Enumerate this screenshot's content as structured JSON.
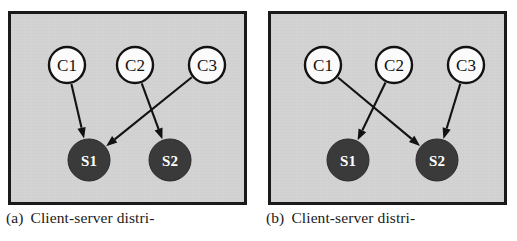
{
  "figure": {
    "width": 517,
    "height": 241,
    "background": "#ffffff",
    "panel_background": "#d3d3d3",
    "frame_color": "#1a1a1a",
    "client_node_fill": "#fbfbfb",
    "server_node_fill": "#3a3a3a",
    "edge_color": "#121212"
  },
  "panels": [
    {
      "id": "panel-a",
      "caption_tag": "(a)",
      "caption_text": "Client-server  distri-",
      "clients": [
        {
          "label": "C1",
          "cx": 56,
          "cy": 51,
          "r": 18
        },
        {
          "label": "C2",
          "cx": 124,
          "cy": 51,
          "r": 18
        },
        {
          "label": "C3",
          "cx": 196,
          "cy": 51,
          "r": 18
        }
      ],
      "servers": [
        {
          "label": "S1",
          "cx": 78,
          "cy": 146,
          "r": 21
        },
        {
          "label": "S2",
          "cx": 159,
          "cy": 146,
          "r": 21
        }
      ],
      "edges": [
        {
          "from": "C1",
          "to": "S1"
        },
        {
          "from": "C2",
          "to": "S2"
        },
        {
          "from": "C3",
          "to": "S1"
        }
      ]
    },
    {
      "id": "panel-b",
      "caption_tag": "(b)",
      "caption_text": "Client-server  distri-",
      "clients": [
        {
          "label": "C1",
          "cx": 52,
          "cy": 51,
          "r": 18
        },
        {
          "label": "C2",
          "cx": 123,
          "cy": 51,
          "r": 18
        },
        {
          "label": "C3",
          "cx": 195,
          "cy": 51,
          "r": 18
        }
      ],
      "servers": [
        {
          "label": "S1",
          "cx": 77,
          "cy": 146,
          "r": 21
        },
        {
          "label": "S2",
          "cx": 166,
          "cy": 146,
          "r": 21
        }
      ],
      "edges": [
        {
          "from": "C1",
          "to": "S2"
        },
        {
          "from": "C2",
          "to": "S1"
        },
        {
          "from": "C3",
          "to": "S2"
        }
      ]
    }
  ]
}
